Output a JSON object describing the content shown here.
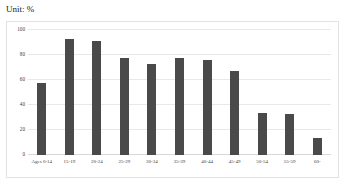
{
  "unit_label": "Unit: %",
  "chart_data": {
    "type": "bar",
    "title": "",
    "subtitle": "",
    "xlabel": "",
    "ylabel": "",
    "unit": "%",
    "unit_note": "Unit: %",
    "categories": [
      "Ages 0-14",
      "15-19",
      "20-24",
      "25-29",
      "30-34",
      "35-39",
      "40-44",
      "45-49",
      "50-54",
      "55-59",
      "60-"
    ],
    "values": [
      58,
      93,
      91,
      78,
      73,
      78,
      76,
      67,
      34,
      33,
      14
    ],
    "ylim": [
      0,
      100
    ],
    "yticks": [
      0,
      20,
      40,
      60,
      80,
      100
    ],
    "ytick_labels": [
      "0",
      "20",
      "40",
      "60",
      "80",
      "100"
    ],
    "grid": true,
    "legend": false,
    "legend_position": "none",
    "bar_color": "#4a4a4a",
    "gridline_color": "#e8e8e8",
    "frame_color": "#e2e2e2",
    "background": "#ffffff"
  }
}
